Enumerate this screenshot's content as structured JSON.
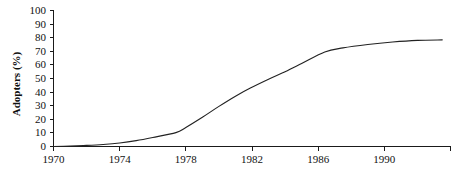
{
  "chart_data": {
    "type": "line",
    "title": "",
    "xlabel": "",
    "ylabel": "Adopters (%)",
    "xlim": [
      1970,
      1994
    ],
    "ylim": [
      0,
      100
    ],
    "grid": false,
    "legend": "none",
    "x_tick_labels": [
      "1970",
      "1974",
      "1978",
      "1982",
      "1986",
      "1990"
    ],
    "x_tick_values": [
      1970,
      1974,
      1978,
      1982,
      1986,
      1990
    ],
    "x_tick_values_all": [
      1970,
      1974,
      1978,
      1982,
      1986,
      1990,
      1994
    ],
    "y_tick_labels": [
      "0",
      "10",
      "20",
      "30",
      "40",
      "50",
      "60",
      "70",
      "80",
      "90",
      "100"
    ],
    "y_tick_values": [
      0,
      10,
      20,
      30,
      40,
      50,
      60,
      70,
      80,
      90,
      100
    ],
    "series": [
      {
        "name": "Adopters",
        "color": "#222222",
        "x": [
          1970.0,
          1971.0,
          1972.0,
          1973.0,
          1974.0,
          1975.0,
          1976.0,
          1977.4,
          1978.0,
          1979.0,
          1980.0,
          1981.0,
          1981.9,
          1983.0,
          1984.0,
          1985.0,
          1986.4,
          1987.5,
          1989.0,
          1990.5,
          1992.0,
          1993.5
        ],
        "y": [
          0.0,
          0.3,
          0.8,
          1.5,
          2.6,
          4.3,
          6.6,
          10.2,
          14.0,
          21.5,
          29.5,
          37.0,
          43.0,
          49.5,
          55.0,
          61.0,
          69.5,
          72.5,
          75.0,
          76.8,
          78.0,
          78.4
        ]
      }
    ]
  }
}
